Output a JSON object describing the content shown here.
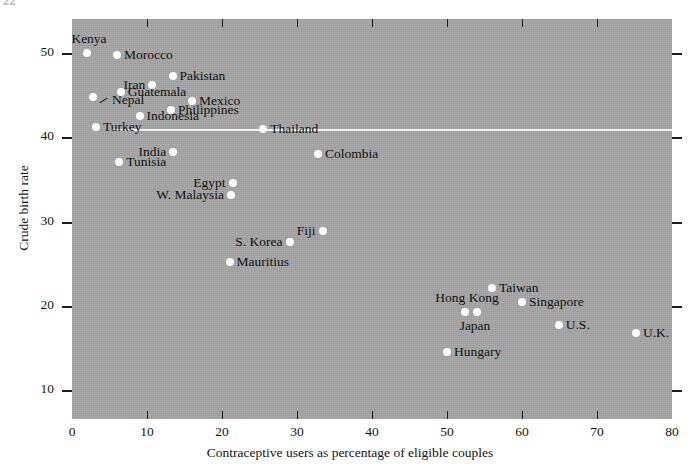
{
  "page": {
    "corner_mark": "22"
  },
  "chart_data": {
    "type": "scatter",
    "title": "",
    "xlabel": "Contraceptive users as percentage of eligible couples",
    "ylabel": "Crude birth rate",
    "xlim": [
      0,
      80
    ],
    "ylim": [
      6.6,
      54.0
    ],
    "xticks": [
      0,
      10,
      20,
      30,
      40,
      50,
      60,
      70,
      80
    ],
    "yticks": [
      10,
      20,
      30,
      40,
      50
    ],
    "grid": false,
    "legend": null,
    "background": "#a6a6a6",
    "point_color": "#fbfbfb",
    "annotations": [
      {
        "name": "reference-rule",
        "kind": "horizontal-line",
        "y": 41.0,
        "x_start": 5.3,
        "x_end": 80.0,
        "color": "#f2f2f2"
      }
    ],
    "points": [
      {
        "label": "Kenya",
        "x": 2.0,
        "y": 50.0,
        "label_pos": "above"
      },
      {
        "label": "Morocco",
        "x": 6.0,
        "y": 49.7,
        "label_pos": "right"
      },
      {
        "label": "Pakistan",
        "x": 13.4,
        "y": 47.2,
        "label_pos": "right"
      },
      {
        "label": "Iran",
        "x": 10.7,
        "y": 46.2,
        "label_pos": "left"
      },
      {
        "label": "Guatemala",
        "x": 6.5,
        "y": 45.3,
        "label_pos": "right"
      },
      {
        "label": "Nepal",
        "x": 2.8,
        "y": 44.7,
        "label_pos": "leader"
      },
      {
        "label": "Mexico",
        "x": 16.0,
        "y": 44.3,
        "label_pos": "right"
      },
      {
        "label": "Philippines",
        "x": 13.2,
        "y": 43.2,
        "label_pos": "right"
      },
      {
        "label": "Indonesia",
        "x": 9.0,
        "y": 42.5,
        "label_pos": "right"
      },
      {
        "label": "Turkey",
        "x": 3.2,
        "y": 41.2,
        "label_pos": "right"
      },
      {
        "label": "Thailand",
        "x": 25.5,
        "y": 41.0,
        "label_pos": "right"
      },
      {
        "label": "India",
        "x": 13.5,
        "y": 38.2,
        "label_pos": "left"
      },
      {
        "label": "Colombia",
        "x": 32.8,
        "y": 38.0,
        "label_pos": "right"
      },
      {
        "label": "Tunisia",
        "x": 6.3,
        "y": 37.1,
        "label_pos": "right"
      },
      {
        "label": "Egypt",
        "x": 21.4,
        "y": 34.6,
        "label_pos": "left"
      },
      {
        "label": "W. Malaysia",
        "x": 21.2,
        "y": 33.1,
        "label_pos": "left"
      },
      {
        "label": "Fiji",
        "x": 33.4,
        "y": 28.9,
        "label_pos": "left"
      },
      {
        "label": "S. Korea",
        "x": 29.0,
        "y": 27.6,
        "label_pos": "left"
      },
      {
        "label": "Mauritius",
        "x": 21.0,
        "y": 25.2,
        "label_pos": "right"
      },
      {
        "label": "Taiwan",
        "x": 56.0,
        "y": 22.1,
        "label_pos": "right"
      },
      {
        "label": "Singapore",
        "x": 60.0,
        "y": 20.5,
        "label_pos": "right"
      },
      {
        "label": "Hong Kong",
        "x": 52.4,
        "y": 19.3,
        "label_pos": "above"
      },
      {
        "label": "Japan",
        "x": 54.0,
        "y": 19.3,
        "label_pos": "below"
      },
      {
        "label": "U.S.",
        "x": 64.9,
        "y": 17.7,
        "label_pos": "right"
      },
      {
        "label": "U.K.",
        "x": 75.2,
        "y": 16.8,
        "label_pos": "right"
      },
      {
        "label": "Hungary",
        "x": 50.0,
        "y": 14.5,
        "label_pos": "right"
      }
    ]
  }
}
